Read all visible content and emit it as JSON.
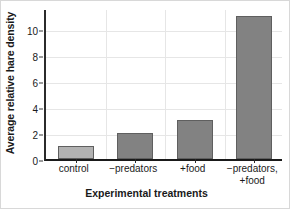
{
  "chart_data": {
    "type": "bar",
    "title": "",
    "categories": [
      "control",
      "−predators",
      "+food",
      "−predators,\n+food"
    ],
    "values": [
      1,
      2,
      3,
      11
    ],
    "series": [
      {
        "name": "Average relative hare density",
        "values": [
          1,
          2,
          3,
          11
        ]
      }
    ],
    "xlabel": "Experimental treatments",
    "ylabel": "Average relative hare density",
    "ylim": [
      0,
      11.6
    ],
    "yticks": [
      0,
      2,
      4,
      6,
      8,
      10
    ],
    "ytick_labels": [
      "0",
      "2",
      "4",
      "6",
      "8",
      "10"
    ],
    "grid": true,
    "grid_axis": "both",
    "legend": false,
    "legend_position": "none",
    "bar_colors": [
      "#b2b2b2",
      "#828282",
      "#828282",
      "#828282"
    ],
    "bar_edge_color": "#5f5f5f",
    "grid_color": "#e6e6e6",
    "axis_color": "#1a1a1a",
    "background_color": "#ffffff",
    "frame_color": "#d8d8d8"
  }
}
